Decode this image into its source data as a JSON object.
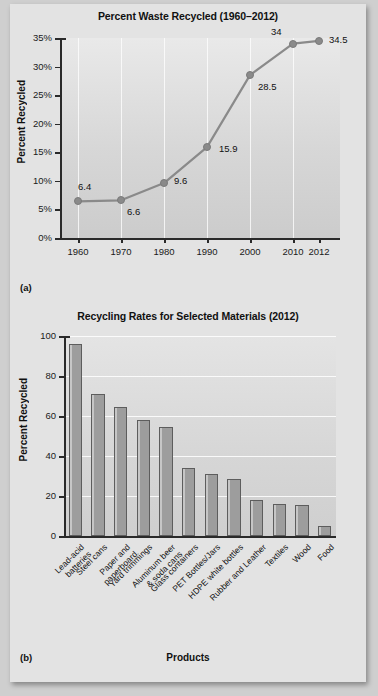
{
  "figure": {
    "panel_a_tag": "(a)",
    "panel_b_tag": "(b)"
  },
  "chart_data": [
    {
      "type": "line",
      "title": "Percent Waste Recycled (1960–2012)",
      "xlabel": "",
      "ylabel": "Percent Recycled",
      "x": [
        1960,
        1970,
        1980,
        1990,
        2000,
        2010,
        2012
      ],
      "categories": [
        "1960",
        "1970",
        "1980",
        "1990",
        "2000",
        "2010",
        "2012"
      ],
      "values": [
        6.4,
        6.6,
        9.6,
        15.9,
        28.5,
        34,
        34.5
      ],
      "point_labels": [
        "6.4",
        "6.6",
        "9.6",
        "15.9",
        "28.5",
        "34",
        "34.5"
      ],
      "ylim": [
        0,
        35
      ],
      "yticks": [
        0,
        5,
        10,
        15,
        20,
        25,
        30,
        35
      ],
      "ytick_labels": [
        "0%",
        "5%",
        "10%",
        "15%",
        "20%",
        "25%",
        "30%",
        "35%"
      ],
      "grid": "vertical",
      "legend": "none",
      "line_color": "#8a8a8a",
      "marker_color": "#8a8a8a"
    },
    {
      "type": "bar",
      "title": "Recycling Rates for Selected Materials (2012)",
      "xlabel": "Products",
      "ylabel": "Percent Recycled",
      "categories": [
        "Lead-acid batteries",
        "Steel cans",
        "Paper and paperboard",
        "Yard trimmings",
        "Aluminum beer & soda cans",
        "Glass containers",
        "PET Bottles/Jars",
        "HDPE white bottles",
        "Rubber and Leather",
        "Textiles",
        "Wood",
        "Food"
      ],
      "category_lines": [
        [
          "Lead-acid",
          "batteries"
        ],
        [
          "Steel cans"
        ],
        [
          "Paper and",
          "paperboard"
        ],
        [
          "Yard trimmings"
        ],
        [
          "Aluminum beer",
          "& soda cans"
        ],
        [
          "Glass containers"
        ],
        [
          "PET Bottles/Jars"
        ],
        [
          "HDPE white bottles"
        ],
        [
          "Rubber and Leather"
        ],
        [
          "Textiles"
        ],
        [
          "Wood"
        ],
        [
          "Food"
        ]
      ],
      "values": [
        96,
        71,
        64.5,
        58,
        54.5,
        34,
        31,
        28.5,
        18,
        16,
        15.5,
        5
      ],
      "ylim": [
        0,
        100
      ],
      "yticks": [
        0,
        20,
        40,
        60,
        80,
        100
      ],
      "ytick_labels": [
        "0",
        "20",
        "40",
        "60",
        "80",
        "100"
      ],
      "grid": "horizontal",
      "legend": "none",
      "bar_color": "#9d9d9d"
    }
  ]
}
